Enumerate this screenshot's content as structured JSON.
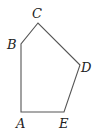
{
  "diagram": {
    "type": "pentagon",
    "stroke_color": "#555555",
    "vertices": [
      {
        "label": "A",
        "x": 21,
        "y": 112
      },
      {
        "label": "B",
        "x": 21,
        "y": 44
      },
      {
        "label": "C",
        "x": 38,
        "y": 23
      },
      {
        "label": "D",
        "x": 80,
        "y": 65
      },
      {
        "label": "E",
        "x": 64,
        "y": 112
      }
    ],
    "labels": {
      "A": "A",
      "B": "B",
      "C": "C",
      "D": "D",
      "E": "E"
    }
  }
}
